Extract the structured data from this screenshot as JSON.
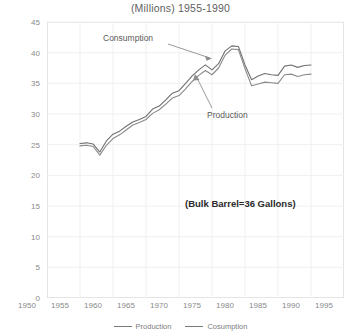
{
  "chart_data": {
    "type": "line",
    "title": "(Millions) 1955-1990",
    "xlabel": "",
    "ylabel": "",
    "xlim": [
      1950,
      1995
    ],
    "ylim": [
      0,
      45
    ],
    "grid": true,
    "legend_position": "bottom",
    "xticks": [
      1950,
      1955,
      1960,
      1965,
      1970,
      1975,
      1980,
      1985,
      1990,
      1995
    ],
    "yticks": [
      0,
      5,
      10,
      15,
      20,
      25,
      30,
      35,
      40,
      45
    ],
    "annotations": [
      {
        "text": "Consumption",
        "x": 1963.5,
        "y": 42.2
      },
      {
        "text": "Production",
        "x": 1976.5,
        "y": 31.0
      },
      {
        "text": "(Bulk Barrel=36 Gallons)",
        "x": 1976.0,
        "y": 16.0,
        "bold": true
      }
    ],
    "x": [
      1955,
      1956,
      1957,
      1958,
      1959,
      1960,
      1961,
      1962,
      1963,
      1964,
      1965,
      1966,
      1967,
      1968,
      1969,
      1970,
      1971,
      1972,
      1973,
      1974,
      1975,
      1976,
      1977,
      1978,
      1979,
      1980,
      1981,
      1982,
      1983,
      1984,
      1985,
      1986,
      1987,
      1988,
      1989,
      1990
    ],
    "series": [
      {
        "name": "Consumption",
        "color": "#707070",
        "values": [
          25.2,
          25.3,
          25.1,
          23.8,
          25.6,
          26.7,
          27.2,
          28.0,
          28.7,
          29.1,
          29.6,
          30.8,
          31.3,
          32.3,
          33.4,
          33.8,
          35.0,
          36.2,
          37.2,
          38.0,
          37.2,
          38.2,
          40.3,
          41.1,
          41.0,
          38.0,
          35.6,
          36.2,
          36.6,
          36.4,
          36.3,
          37.8,
          38.0,
          37.6,
          37.9,
          38.0
        ]
      },
      {
        "name": "Cosumption",
        "color": "#8a8a8a",
        "values": [
          24.8,
          24.9,
          24.7,
          23.3,
          24.9,
          26.0,
          26.6,
          27.4,
          28.2,
          28.6,
          29.1,
          30.1,
          30.7,
          31.6,
          32.6,
          33.0,
          34.1,
          35.3,
          36.3,
          37.1,
          36.4,
          37.5,
          39.6,
          40.6,
          40.5,
          37.4,
          34.6,
          34.9,
          35.2,
          35.1,
          35.0,
          36.4,
          36.5,
          36.1,
          36.4,
          36.5
        ]
      }
    ],
    "legend": [
      {
        "label": "Production",
        "color": "#7a7a7a"
      },
      {
        "label": "Cosumption",
        "color": "#7a7a7a"
      }
    ]
  }
}
